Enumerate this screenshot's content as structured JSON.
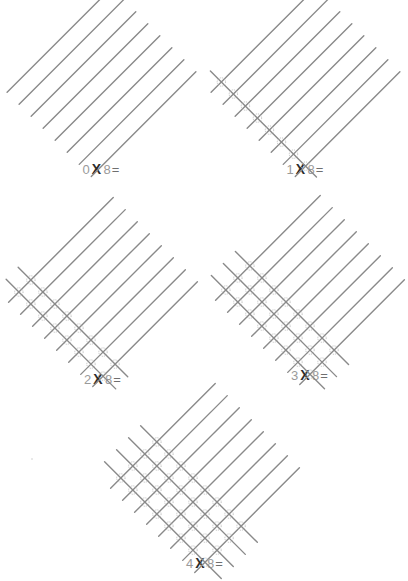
{
  "page": {
    "background_color": "#ffffff",
    "width": 408,
    "height": 581
  },
  "style": {
    "line_color": "#8a8a8a",
    "line_width": 1.4,
    "node_stroke": "#b5b5b5",
    "node_fill": "none",
    "digit_color": "#9a9a9a",
    "operator_color": "#2b2b2b",
    "equals_color": "#6f6f6f"
  },
  "problems": [
    {
      "id": "problem-0x8",
      "multiplier": 0,
      "multiplicand": 8,
      "label": {
        "left": "0",
        "operator": "X",
        "right": "8",
        "equals": "=",
        "full": "0 X 8 ="
      },
      "answer_blank": true,
      "intersections": 0,
      "lines": {
        "up_right": 8,
        "down_right": 0
      },
      "position": {
        "left": 14,
        "top": 8,
        "label_top": 158
      },
      "geometry": {
        "cell": 17,
        "length": 148,
        "cross_length": 150
      }
    },
    {
      "id": "problem-1x8",
      "multiplier": 1,
      "multiplicand": 8,
      "label": {
        "left": "1",
        "operator": "X",
        "right": "8",
        "equals": "=",
        "full": "1 X 8 ="
      },
      "answer_blank": true,
      "intersections": 8,
      "lines": {
        "up_right": 8,
        "down_right": 1
      },
      "position": {
        "left": 218,
        "top": 8,
        "label_top": 158
      },
      "geometry": {
        "cell": 17,
        "length": 148,
        "cross_length": 150
      }
    },
    {
      "id": "problem-2x8",
      "multiplier": 2,
      "multiplicand": 8,
      "label": {
        "left": "2",
        "operator": "X",
        "right": "8",
        "equals": "=",
        "full": "2 X 8 ="
      },
      "answer_blank": true,
      "intersections": 16,
      "lines": {
        "up_right": 8,
        "down_right": 2
      },
      "position": {
        "left": 8,
        "top": 218,
        "label_top": 370
      },
      "geometry": {
        "cell": 17,
        "length": 148,
        "cross_length": 155
      }
    },
    {
      "id": "problem-3x8",
      "multiplier": 3,
      "multiplicand": 8,
      "label": {
        "left": "3",
        "operator": "X",
        "right": "8",
        "equals": "=",
        "full": "3 X 8 ="
      },
      "answer_blank": true,
      "intersections": 24,
      "lines": {
        "up_right": 8,
        "down_right": 3
      },
      "position": {
        "left": 218,
        "top": 216,
        "label_top": 366
      },
      "geometry": {
        "cell": 17,
        "length": 148,
        "cross_length": 160
      }
    },
    {
      "id": "problem-4x8",
      "multiplier": 4,
      "multiplicand": 8,
      "label": {
        "left": "4",
        "operator": "X",
        "right": "8",
        "equals": "=",
        "full": "4 X 8 ="
      },
      "answer_blank": true,
      "intersections": 32,
      "lines": {
        "up_right": 8,
        "down_right": 4
      },
      "position": {
        "left": 108,
        "top": 404,
        "label_top": 552
      },
      "geometry": {
        "cell": 17,
        "length": 148,
        "cross_length": 165
      }
    }
  ]
}
